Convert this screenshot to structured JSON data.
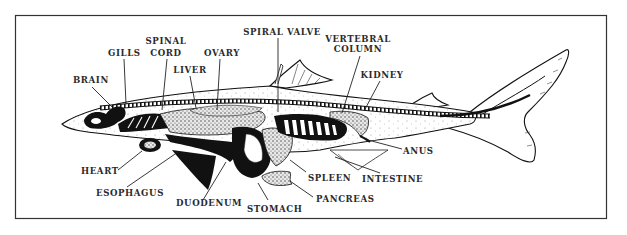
{
  "diagram": {
    "title": "",
    "frame": {
      "x": 15,
      "y": 15,
      "width": 592,
      "height": 204,
      "color": "#333333"
    },
    "labels": [
      {
        "id": "brain",
        "text": "BRAIN",
        "x": 73,
        "y": 83,
        "anchor": "start",
        "line": [
          [
            92,
            87
          ],
          [
            112,
            107
          ]
        ]
      },
      {
        "id": "gills",
        "text": "GILLS",
        "x": 108,
        "y": 56,
        "anchor": "start",
        "line": [
          [
            124,
            59
          ],
          [
            126,
            104
          ]
        ]
      },
      {
        "id": "spinal-cord-1",
        "text": "SPINAL",
        "x": 166,
        "y": 44,
        "anchor": "middle",
        "line": null
      },
      {
        "id": "spinal-cord-2",
        "text": "CORD",
        "x": 166,
        "y": 56,
        "anchor": "middle",
        "line": [
          [
            167,
            59
          ],
          [
            162,
            110
          ]
        ]
      },
      {
        "id": "liver",
        "text": "LIVER",
        "x": 190,
        "y": 73,
        "anchor": "middle",
        "line": [
          [
            190,
            76
          ],
          [
            196,
            108
          ]
        ]
      },
      {
        "id": "ovary",
        "text": "OVARY",
        "x": 222,
        "y": 56,
        "anchor": "middle",
        "line": [
          [
            220,
            59
          ],
          [
            217,
            110
          ]
        ]
      },
      {
        "id": "spiral-valve",
        "text": "SPIRAL VALVE",
        "x": 282,
        "y": 35,
        "anchor": "middle",
        "line": [
          [
            278,
            38
          ],
          [
            278,
            112
          ]
        ]
      },
      {
        "id": "vertebral-column-1",
        "text": "VERTEBRAL",
        "x": 358,
        "y": 42,
        "anchor": "middle",
        "line": null
      },
      {
        "id": "vertebral-column-2",
        "text": "COLUMN",
        "x": 358,
        "y": 52,
        "anchor": "middle",
        "line": [
          [
            360,
            56
          ],
          [
            342,
            113
          ]
        ]
      },
      {
        "id": "kidney",
        "text": "KIDNEY",
        "x": 382,
        "y": 78,
        "anchor": "middle",
        "line": [
          [
            380,
            81
          ],
          [
            364,
            111
          ]
        ]
      },
      {
        "id": "heart",
        "text": "HEART",
        "x": 81,
        "y": 174,
        "anchor": "start",
        "line": [
          [
            118,
            170
          ],
          [
            142,
            151
          ]
        ]
      },
      {
        "id": "esophagus",
        "text": "ESOPHAGUS",
        "x": 96,
        "y": 196,
        "anchor": "start",
        "line": [
          [
            127,
            187
          ],
          [
            178,
            152
          ]
        ]
      },
      {
        "id": "duodenum",
        "text": "DUODENUM",
        "x": 176,
        "y": 206,
        "anchor": "start",
        "line": [
          [
            203,
            200
          ],
          [
            226,
            162
          ]
        ]
      },
      {
        "id": "stomach",
        "text": "STOMACH",
        "x": 247,
        "y": 212,
        "anchor": "start",
        "line": [
          [
            268,
            200
          ],
          [
            258,
            183
          ]
        ]
      },
      {
        "id": "pancreas",
        "text": "PANCREAS",
        "x": 316,
        "y": 202,
        "anchor": "start",
        "line": [
          [
            313,
            197
          ],
          [
            290,
            181
          ]
        ]
      },
      {
        "id": "spleen",
        "text": "SPLEEN",
        "x": 308,
        "y": 181,
        "anchor": "start",
        "line": [
          [
            306,
            172
          ],
          [
            290,
            160
          ]
        ]
      },
      {
        "id": "intestine",
        "text": "INTESTINE",
        "x": 362,
        "y": 182,
        "anchor": "start",
        "line": [
          [
            380,
            173
          ],
          [
            335,
            157
          ]
        ]
      },
      {
        "id": "anus",
        "text": "ANUS",
        "x": 403,
        "y": 154,
        "anchor": "start",
        "line": [
          [
            402,
            149
          ],
          [
            368,
            140
          ]
        ]
      }
    ]
  }
}
